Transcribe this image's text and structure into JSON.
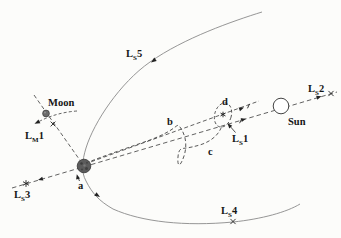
{
  "figure": {
    "bodies": {
      "moon_label": "Moon",
      "sun_label": "Sun"
    },
    "lagrange_points": {
      "ls1": {
        "base": "L",
        "sub": "S",
        "num": "1"
      },
      "ls2": {
        "base": "L",
        "sub": "S",
        "num": "2"
      },
      "ls3": {
        "base": "L",
        "sub": "S",
        "num": "3"
      },
      "ls4": {
        "base": "L",
        "sub": "S",
        "num": "4"
      },
      "ls5": {
        "base": "L",
        "sub": "S",
        "num": "5"
      },
      "lm1": {
        "base": "L",
        "sub": "M",
        "num": "1"
      }
    },
    "trajectory_labels": {
      "a": "a",
      "b": "b",
      "c": "c",
      "d": "d"
    },
    "colors": {
      "background": "#fcfcfa",
      "orbit_line": "#8a8a8a",
      "dashed_line": "#3a3a3a",
      "text": "#161616",
      "earth_fill": "#5c5c5c",
      "moon_fill": "#6b6b6b",
      "sun_fill": "#ffffff"
    }
  }
}
